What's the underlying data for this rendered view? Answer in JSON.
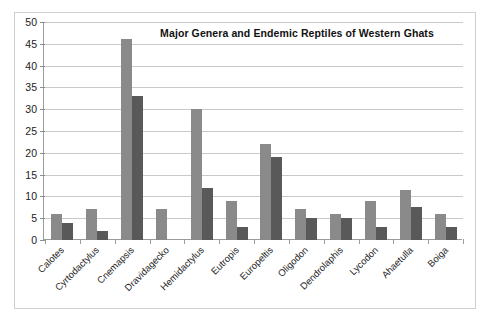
{
  "figure": {
    "title": "Major Genera and Endemic Reptiles of Western Ghats",
    "frame_color": "#cfcfcf",
    "axis_color": "#9b9b9b",
    "grid_color": "#c9c9c9",
    "series1_color": "#8a8a8a",
    "series2_color": "#595959"
  },
  "chart_data": {
    "type": "bar",
    "title": "Major Genera and Endemic Reptiles of Western Ghats",
    "xlabel": "",
    "ylabel": "",
    "ylim": [
      0,
      50
    ],
    "ytick_step": 5,
    "yticks": [
      50,
      45,
      40,
      35,
      30,
      25,
      20,
      15,
      10,
      5,
      0
    ],
    "ytick_labels": [
      "50",
      "45",
      "40",
      "35",
      "30",
      "25",
      "20",
      "15",
      "10",
      "5",
      "0"
    ],
    "grid": true,
    "gridlines": "horizontal",
    "legend": "none",
    "legend_position": "none",
    "categories": [
      "Calotes",
      "Cyrtodactylus",
      "Cnemapsis",
      "Dravidagecko",
      "Hemidactylus",
      "Eutropis",
      "Europeltis",
      "Oligodon",
      "Dendrolaphis",
      "Lycodon",
      "Ahaetulla",
      "Boiga"
    ],
    "series": [
      {
        "name": "Major Genera",
        "color": "#8a8a8a",
        "values": [
          6,
          7,
          46,
          7,
          30,
          9,
          22,
          7,
          6,
          9,
          11.5,
          6
        ]
      },
      {
        "name": "Endemic Reptiles",
        "color": "#595959",
        "values": [
          4,
          2,
          33,
          0,
          12,
          3,
          19,
          5,
          5,
          3,
          7.5,
          3
        ]
      }
    ]
  }
}
